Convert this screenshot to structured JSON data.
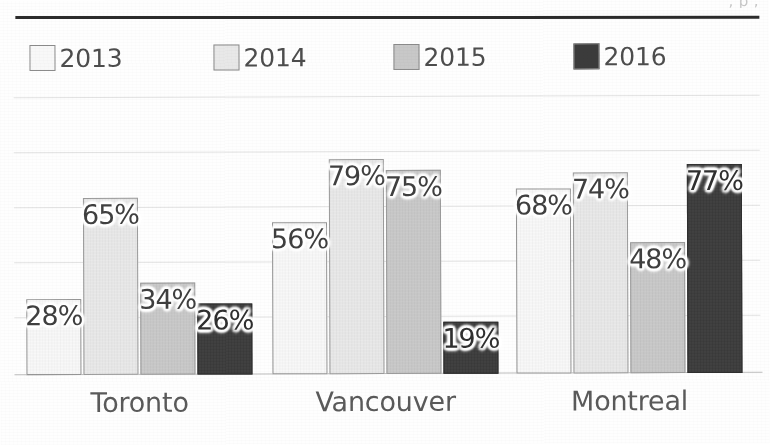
{
  "heading_cropped": ", p ;",
  "legend": {
    "items": [
      {
        "label": "2013",
        "color": "#f8f8f8"
      },
      {
        "label": "2014",
        "color": "#e8e8e8"
      },
      {
        "label": "2015",
        "color": "#c8c8c8"
      },
      {
        "label": "2016",
        "color": "#3b3b3b"
      }
    ]
  },
  "chart_data": {
    "type": "bar",
    "title": "",
    "xlabel": "",
    "ylabel": "",
    "ylim": [
      0,
      100
    ],
    "grid": true,
    "legend_position": "top-left",
    "value_suffix": "%",
    "categories": [
      "Toronto",
      "Vancouver",
      "Montreal"
    ],
    "series": [
      {
        "name": "2013",
        "color": "#f8f8f8",
        "values": [
          28,
          56,
          68
        ],
        "labels": [
          "28%",
          "56%",
          "68%"
        ]
      },
      {
        "name": "2014",
        "color": "#e8e8e8",
        "values": [
          65,
          79,
          74
        ],
        "labels": [
          "65%",
          "79%",
          "74%"
        ]
      },
      {
        "name": "2015",
        "color": "#c8c8c8",
        "values": [
          34,
          75,
          48
        ],
        "labels": [
          "34%",
          "75%",
          "48%"
        ]
      },
      {
        "name": "2016",
        "color": "#3b3b3b",
        "values": [
          26,
          19,
          77
        ],
        "labels": [
          "26%",
          "19%",
          "77%"
        ]
      }
    ]
  }
}
